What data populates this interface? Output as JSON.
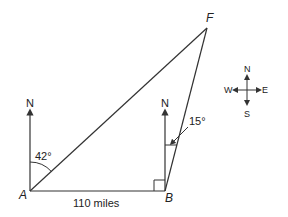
{
  "diagram": {
    "points": {
      "A": {
        "label": "A",
        "x": 30,
        "y": 191
      },
      "B": {
        "label": "B",
        "x": 165,
        "y": 191
      },
      "F": {
        "label": "F",
        "x": 207,
        "y": 28
      }
    },
    "north_label_A": "N",
    "north_label_B": "N",
    "angle_A": "42°",
    "angle_B": "15°",
    "distance_AB": "110 miles",
    "compass": {
      "north": "N",
      "south": "S",
      "east": "E",
      "west": "W"
    },
    "line_color": "#333333"
  }
}
